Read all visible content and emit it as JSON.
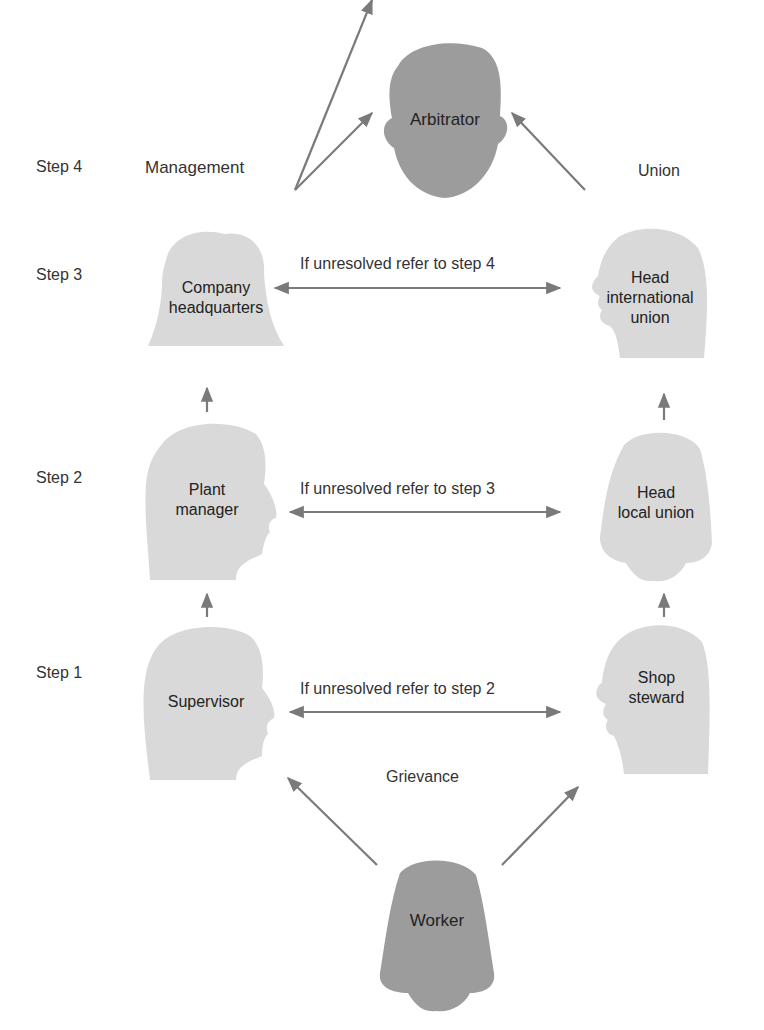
{
  "colors": {
    "light_head": "#d9d9d9",
    "dark_head": "#9c9c9c",
    "arrow": "#7a7a7a",
    "text": "#2a2a2a"
  },
  "steps": [
    "Step 1",
    "Step 2",
    "Step 3",
    "Step 4"
  ],
  "columns": {
    "management": "Management",
    "union": "Union"
  },
  "nodes": {
    "arbitrator": {
      "label": "Arbitrator"
    },
    "company_hq": {
      "line1": "Company",
      "line2": "headquarters"
    },
    "head_international": {
      "line1": "Head",
      "line2": "international",
      "line3": "union"
    },
    "plant_manager": {
      "line1": "Plant",
      "line2": "manager"
    },
    "head_local": {
      "line1": "Head",
      "line2": "local union"
    },
    "supervisor": {
      "label": "Supervisor"
    },
    "shop_steward": {
      "line1": "Shop",
      "line2": "steward"
    },
    "worker": {
      "label": "Worker"
    }
  },
  "connectors": {
    "step1": "If unresolved refer to step 2",
    "step2": "If unresolved refer to step 3",
    "step3": "If unresolved refer to step 4",
    "grievance": "Grievance"
  }
}
